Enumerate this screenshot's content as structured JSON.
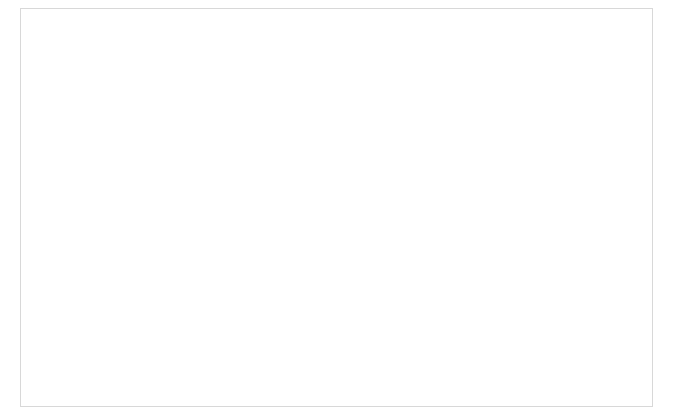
{
  "figure": {
    "width": 673,
    "height": 415,
    "background": "#ffffff",
    "border_color": "#d8d8d8"
  },
  "style": {
    "sarcomatoid_fill": "#9a9a9a",
    "epithelioid_fill": "#c4c4c4",
    "box_stroke": "#6e6e6e",
    "median_stroke": "#4a4a4a",
    "whisker_stroke": "#8e8e8e",
    "axis_color": "#bdbdbd",
    "outlier_color": "#9a9a9a",
    "text_color": "#6b6b6b",
    "title_color": "#333333"
  },
  "shared": {
    "xlabel": "Tumor Cell Population",
    "categories": [
      "Sarcomatoid",
      "Epithelioid"
    ]
  },
  "chart_data": [
    {
      "id": "A",
      "letter": "A",
      "type": "box",
      "title": "",
      "xlabel": "Tumor Cell Population",
      "ylabel": "Tumor Cellularity (mean cell number/mm²)",
      "categories": [
        "Sarcomatoid",
        "Epithelioid"
      ],
      "ylim": [
        30,
        100
      ],
      "yticks": [
        40,
        60,
        80,
        100
      ],
      "ytick_labels": [
        "40",
        "60",
        "80",
        "100"
      ],
      "grid": false,
      "boxes": [
        {
          "name": "Sarcomatoid",
          "min": 44,
          "q1": 53,
          "median": 57.5,
          "q3": 66,
          "max": 75.5,
          "fill": "#9a9a9a",
          "outliers": [],
          "extremes": []
        },
        {
          "name": "Epithelioid",
          "min": 51.5,
          "q1": 74,
          "median": 79,
          "q3": 83,
          "max": 95,
          "fill": "#c4c4c4",
          "outliers": [
            50
          ],
          "extremes": []
        }
      ]
    },
    {
      "id": "B",
      "letter": "B",
      "type": "box",
      "title": "",
      "xlabel": "Tumor Cell Population",
      "ylabel": "Hyaluronic Acid (area fraction/mm²)",
      "categories": [
        "Sarcomatoid",
        "Epithelioid"
      ],
      "ylim": [
        0,
        3.0
      ],
      "yticks": [
        0,
        0.5,
        1.0,
        1.5,
        2.0,
        2.5,
        3.0
      ],
      "ytick_labels": [
        "0",
        "5",
        "10",
        "15",
        "20",
        "25",
        "30"
      ],
      "grid": false,
      "boxes": [
        {
          "name": "Sarcomatoid",
          "min": 0.46,
          "q1": 0.88,
          "median": 1.14,
          "q3": 1.56,
          "max": 2.12,
          "fill": "#9a9a9a",
          "outliers": [],
          "extremes": [
            2.68
          ]
        },
        {
          "name": "Epithelioid",
          "min": 0.03,
          "q1": 0.64,
          "median": 0.83,
          "q3": 1.12,
          "max": 1.42,
          "fill": "#c4c4c4",
          "outliers": [],
          "extremes": [
            1.74
          ]
        }
      ]
    },
    {
      "id": "C",
      "letter": "C",
      "type": "box",
      "title": "",
      "xlabel": "Tumor Cell Population",
      "ylabel": "Elastin (area fraction/mm²)",
      "categories": [
        "Sarcomatoid",
        "Epithelioid"
      ],
      "ylim": [
        0,
        16
      ],
      "yticks": [
        0,
        3,
        6,
        10,
        13
      ],
      "ytick_labels": [
        "0",
        "3",
        "6",
        "10",
        "13"
      ],
      "grid": false,
      "boxes": [
        {
          "name": "Sarcomatoid",
          "min": 0.5,
          "q1": 1.8,
          "median": 3.1,
          "q3": 4.0,
          "max": 5.6,
          "fill": "#9a9a9a",
          "outliers": [],
          "extremes": []
        },
        {
          "name": "Epithelioid",
          "min": 0.7,
          "q1": 3.0,
          "median": 4.4,
          "q3": 6.3,
          "max": 9.9,
          "fill": "#c4c4c4",
          "outliers": [
            12.1
          ],
          "extremes": [
            13.6
          ]
        }
      ]
    },
    {
      "id": "D",
      "letter": "D",
      "type": "box",
      "title": "",
      "xlabel": "Tumor Cell Population",
      "ylabel": "Total Collagen (area fraction/mm²)",
      "categories": [
        "Sarcomatoid",
        "Epithelioid"
      ],
      "ylim": [
        0,
        40
      ],
      "yticks": [
        0,
        10,
        20,
        30,
        40
      ],
      "ytick_labels": [
        "0",
        "10",
        "20",
        "30",
        "40"
      ],
      "grid": false,
      "boxes": [
        {
          "name": "Sarcomatoid",
          "min": 12.5,
          "q1": 21.0,
          "median": 26.5,
          "q3": 31.5,
          "max": 34.0,
          "fill": "#9a9a9a",
          "outliers": [],
          "extremes": [
            37.5
          ]
        },
        {
          "name": "Epithelioid",
          "min": 1.0,
          "q1": 9.5,
          "median": 14.5,
          "q3": 18.5,
          "max": 24.5,
          "fill": "#c4c4c4",
          "outliers": [],
          "extremes": []
        }
      ]
    }
  ]
}
